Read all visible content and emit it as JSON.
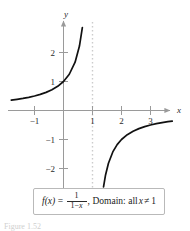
{
  "figure": {
    "caption": "Figure 1.52",
    "axes": {
      "x_name": "x",
      "y_name": "y",
      "x_ticks": [
        {
          "value": -1,
          "label": "−1"
        },
        {
          "value": 1,
          "label": "1"
        },
        {
          "value": 2,
          "label": "2"
        },
        {
          "value": 3,
          "label": "3"
        }
      ],
      "y_ticks": [
        {
          "value": 2,
          "label": "2"
        },
        {
          "value": 1,
          "label": "1"
        },
        {
          "value": -1,
          "label": "−1"
        },
        {
          "value": -2,
          "label": "−2"
        }
      ]
    },
    "asymptote": {
      "label": "x = 1",
      "style": "dotted",
      "color": "#cccccc"
    },
    "formula": {
      "function_name": "f(x)",
      "equals": "=",
      "numerator": "1",
      "denominator_one": "1",
      "denominator_minus": "−",
      "denominator_x": "x",
      "comma": ",",
      "domain_word": "Domain:",
      "all_word": "all",
      "variable": "x",
      "not_equal": "≠",
      "excluded_value": "1"
    },
    "colors": {
      "curve": "#111111",
      "axis": "#9a9a9a",
      "asymptote": "#cccccc",
      "text": "#2b2b2b",
      "box_border": "#b9b9b9",
      "background": "#ffffff"
    }
  },
  "chart_data": {
    "type": "line",
    "title": "",
    "xlabel": "x",
    "ylabel": "y",
    "xlim": [
      -1.85,
      3.85
    ],
    "ylim": [
      -2.6,
      2.9
    ],
    "grid": false,
    "legend": null,
    "equation": "f(x) = 1 / (1 - x)",
    "domain_note": "all x ≠ 1",
    "vertical_asymptote": 1,
    "horizontal_asymptote": 0,
    "xticks": [
      -1,
      1,
      2,
      3
    ],
    "yticks": [
      -2,
      -1,
      1,
      2
    ],
    "series": [
      {
        "name": "left-branch",
        "x": [
          -1.8,
          -1.6,
          -1.4,
          -1.2,
          -1.0,
          -0.8,
          -0.6,
          -0.4,
          -0.2,
          0.0,
          0.2,
          0.4,
          0.55,
          0.65,
          0.7,
          0.74,
          0.78,
          0.81,
          0.83,
          0.845,
          0.855,
          0.862
        ],
        "y": [
          0.357,
          0.385,
          0.417,
          0.455,
          0.5,
          0.556,
          0.625,
          0.714,
          0.833,
          1.0,
          1.25,
          1.667,
          2.222,
          2.857,
          3.333,
          3.846,
          4.545,
          5.263,
          5.882,
          6.452,
          6.897,
          7.246
        ]
      },
      {
        "name": "right-branch",
        "x": [
          1.28,
          1.32,
          1.38,
          1.45,
          1.55,
          1.7,
          1.85,
          2.0,
          2.2,
          2.4,
          2.6,
          2.8,
          3.0,
          3.2,
          3.4,
          3.6,
          3.75
        ],
        "y": [
          -3.571,
          -3.125,
          -2.632,
          -2.222,
          -1.818,
          -1.429,
          -1.176,
          -1.0,
          -0.833,
          -0.714,
          -0.625,
          -0.556,
          -0.5,
          -0.455,
          -0.417,
          -0.385,
          -0.364
        ]
      }
    ]
  }
}
